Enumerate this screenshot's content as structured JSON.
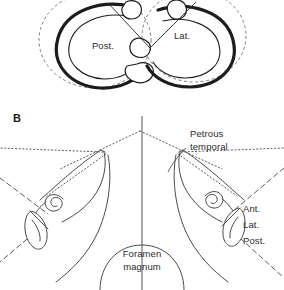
{
  "figure": {
    "panels": [
      {
        "id": "panel-a",
        "label": "",
        "description": "Cropped superior view of two semicircular canals shown as thick tubular rings within dashed spherical outlines, connected by straight lines at their cut ends.",
        "labels": [
          {
            "id": "post-canal",
            "text": "Post.",
            "x": 103,
            "y": 49
          },
          {
            "id": "lat-canal",
            "text": "Lat.",
            "x": 182,
            "y": 39
          }
        ]
      },
      {
        "id": "panel-b",
        "label": "B",
        "description": "Skull base viewed from above showing bilateral petrous temporal bones, cochleae, semicircular canal complexes and the foramen magnum at the midline.",
        "labels": [
          {
            "id": "petrous-temporal",
            "line1": "Petrous",
            "line2": "temporal",
            "x": 190,
            "y": 137
          },
          {
            "id": "foramen-magnum",
            "line1": "Foramen",
            "line2": "magnum",
            "x": 142,
            "y": 253
          },
          {
            "id": "canal-ant",
            "text": "Ant.",
            "x": 243,
            "y": 212
          },
          {
            "id": "canal-lat",
            "text": "Lat.",
            "x": 243,
            "y": 227
          },
          {
            "id": "canal-post",
            "text": "Post.",
            "x": 243,
            "y": 243
          }
        ]
      }
    ],
    "colors": {
      "background": "#ffffff",
      "ink_dark": "#1c1c1c",
      "ink_mid": "#4a4a4a",
      "ink_light": "#6d6d6d",
      "text": "#2b2b2b"
    }
  }
}
